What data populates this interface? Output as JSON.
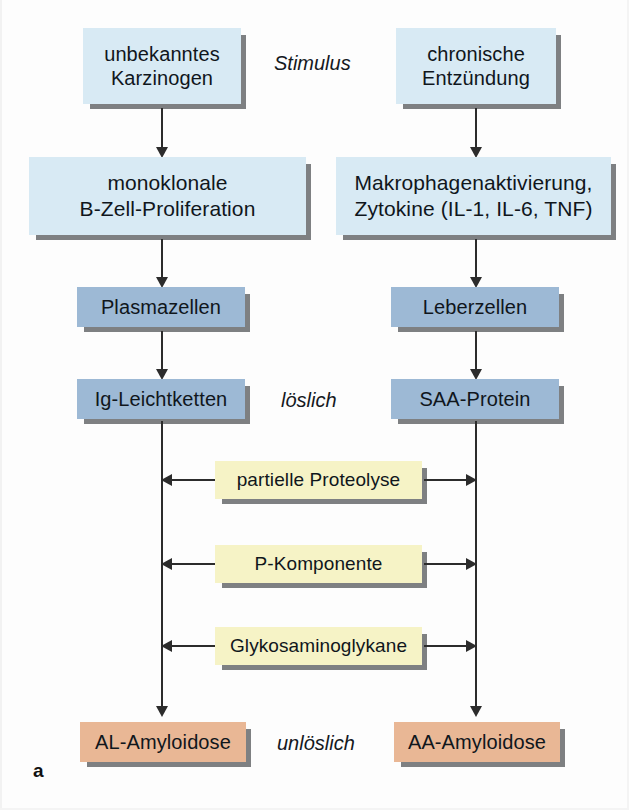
{
  "figure": {
    "panel_letter": "a",
    "side_labels": [
      {
        "text": "Stimulus",
        "name": "label-stimulus"
      },
      {
        "text": "löslich",
        "name": "label-loeslich"
      },
      {
        "text": "unlöslich",
        "name": "label-unloeslich"
      }
    ]
  },
  "left_column": {
    "stimulus": {
      "line1": "unbekanntes",
      "line2": "Karzinogen"
    },
    "process": {
      "line1": "monoklonale",
      "line2": "B-Zell-Proliferation"
    },
    "cells": {
      "line1": "Plasmazellen"
    },
    "protein": {
      "line1": "Ig-Leichtketten"
    },
    "outcome": {
      "line1": "AL-Amyloidose"
    }
  },
  "right_column": {
    "stimulus": {
      "line1": "chronische",
      "line2": "Entzündung"
    },
    "process": {
      "line1": "Makrophagenaktivierung,",
      "line2": "Zytokine (IL-1, IL-6, TNF)"
    },
    "cells": {
      "line1": "Leberzellen"
    },
    "protein": {
      "line1": "SAA-Protein"
    },
    "outcome": {
      "line1": "AA-Amyloidose"
    }
  },
  "middle_column": {
    "modifiers": [
      {
        "label": "partielle Proteolyse"
      },
      {
        "label": "P-Komponente"
      },
      {
        "label": "Glykosaminoglykane"
      }
    ]
  },
  "colors": {
    "light_blue": "#d8eaf4",
    "steel_blue": "#9db9d5",
    "pale_yellow": "#f6f3c6",
    "salmon": "#e9b795",
    "shadow": "#7e8082",
    "line": "#2c2c2c",
    "background": "#fdfdfd"
  }
}
